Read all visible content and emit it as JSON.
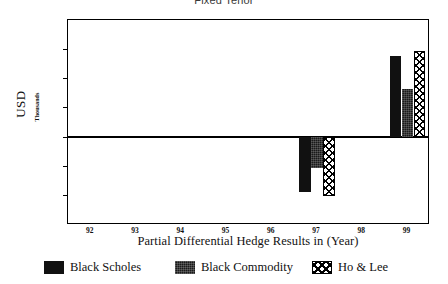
{
  "chart_data": {
    "type": "bar",
    "title": "Fixed Tenor",
    "xlabel": "Partial Differential Hedge Results in (Year)",
    "ylabel": "USD",
    "ylabel_units": "Thousands",
    "categories": [
      "92",
      "93",
      "94",
      "95",
      "96",
      "97",
      "98",
      "99"
    ],
    "ylim": [
      -30,
      40
    ],
    "yticks": [
      "40",
      "30",
      "20",
      "10",
      "0",
      "-10",
      "-20",
      "-30"
    ],
    "ytick_values": [
      40,
      30,
      20,
      10,
      0,
      -10,
      -20,
      -30
    ],
    "grid": false,
    "legend_position": "bottom",
    "series": [
      {
        "name": "Black Scholes",
        "pattern": "solid-black",
        "values": [
          0,
          0,
          0,
          0,
          0,
          -18.8,
          0,
          27.6
        ]
      },
      {
        "name": "Black Commodity",
        "pattern": "dark-textured",
        "values": [
          0,
          0,
          0,
          0,
          0,
          -10.5,
          0,
          16.4
        ]
      },
      {
        "name": "Ho & Lee",
        "pattern": "crosshatch",
        "values": [
          0,
          0,
          0,
          0,
          0,
          -20.1,
          0,
          29.3
        ]
      }
    ]
  }
}
